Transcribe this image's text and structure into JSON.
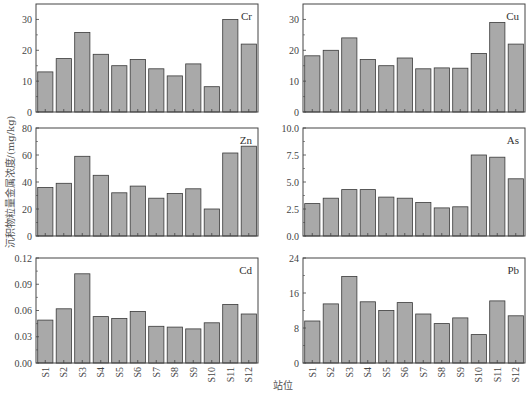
{
  "figure": {
    "ylabel": "沉积物粒量金属浓度/(mg/kg)",
    "xlabel": "站位"
  },
  "chart_data": [
    {
      "type": "bar",
      "title": "Cr",
      "categories": [
        "S1",
        "S2",
        "S3",
        "S4",
        "S5",
        "S6",
        "S7",
        "S8",
        "S9",
        "S10",
        "S11",
        "S12"
      ],
      "values": [
        13.0,
        17.3,
        25.8,
        18.7,
        15.0,
        17.0,
        14.0,
        11.7,
        15.6,
        8.2,
        30.0,
        22.0
      ],
      "ylim": [
        0,
        35
      ],
      "yticks": [
        0,
        10,
        20,
        30
      ],
      "ytick_labels": [
        "0",
        "10",
        "20",
        "30"
      ],
      "xlabel": "",
      "ylabel": "沉积物粒量金属浓度/(mg/kg)",
      "grid": false,
      "legend": "none",
      "position": "top-left"
    },
    {
      "type": "bar",
      "title": "Cu",
      "categories": [
        "S1",
        "S2",
        "S3",
        "S4",
        "S5",
        "S6",
        "S7",
        "S8",
        "S9",
        "S10",
        "S11",
        "S12"
      ],
      "values": [
        18.2,
        20.0,
        24.0,
        17.0,
        15.0,
        17.5,
        14.0,
        14.3,
        14.2,
        19.0,
        29.0,
        22.0
      ],
      "ylim": [
        0,
        35
      ],
      "yticks": [
        0,
        10,
        20,
        30
      ],
      "ytick_labels": [
        "0",
        "10",
        "20",
        "30"
      ],
      "xlabel": "",
      "ylabel": "",
      "grid": false,
      "legend": "none",
      "position": "top-right"
    },
    {
      "type": "bar",
      "title": "Zn",
      "categories": [
        "S1",
        "S2",
        "S3",
        "S4",
        "S5",
        "S6",
        "S7",
        "S8",
        "S9",
        "S10",
        "S11",
        "S12"
      ],
      "values": [
        36.0,
        39.0,
        59.0,
        45.0,
        32.0,
        37.0,
        28.0,
        31.5,
        35.0,
        20.0,
        61.5,
        66.5
      ],
      "ylim": [
        0,
        80
      ],
      "yticks": [
        0,
        20,
        40,
        60,
        80
      ],
      "ytick_labels": [
        "0",
        "20",
        "40",
        "60",
        "80"
      ],
      "xlabel": "",
      "ylabel": "",
      "grid": false,
      "legend": "none",
      "position": "middle-left"
    },
    {
      "type": "bar",
      "title": "As",
      "categories": [
        "S1",
        "S2",
        "S3",
        "S4",
        "S5",
        "S6",
        "S7",
        "S8",
        "S9",
        "S10",
        "S11",
        "S12"
      ],
      "values": [
        3.0,
        3.5,
        4.3,
        4.3,
        3.6,
        3.5,
        3.1,
        2.6,
        2.7,
        7.5,
        7.3,
        5.3
      ],
      "ylim": [
        0,
        10
      ],
      "yticks": [
        0,
        2.5,
        5,
        7.5,
        10
      ],
      "ytick_labels": [
        "0.0",
        "2.5",
        "5.0",
        "7.5",
        "10.0"
      ],
      "xlabel": "",
      "ylabel": "",
      "grid": false,
      "legend": "none",
      "position": "middle-right"
    },
    {
      "type": "bar",
      "title": "Cd",
      "categories": [
        "S1",
        "S2",
        "S3",
        "S4",
        "S5",
        "S6",
        "S7",
        "S8",
        "S9",
        "S10",
        "S11",
        "S12"
      ],
      "values": [
        0.049,
        0.062,
        0.102,
        0.053,
        0.051,
        0.059,
        0.042,
        0.041,
        0.039,
        0.046,
        0.067,
        0.056
      ],
      "ylim": [
        0,
        0.12
      ],
      "yticks": [
        0,
        0.03,
        0.06,
        0.09,
        0.12
      ],
      "ytick_labels": [
        "0.00",
        "0.03",
        "0.06",
        "0.09",
        "0.12"
      ],
      "xlabel": "站位",
      "ylabel": "",
      "grid": false,
      "legend": "none",
      "position": "bottom-left"
    },
    {
      "type": "bar",
      "title": "Pb",
      "categories": [
        "S1",
        "S2",
        "S3",
        "S4",
        "S5",
        "S6",
        "S7",
        "S8",
        "S9",
        "S10",
        "S11",
        "S12"
      ],
      "values": [
        9.6,
        13.5,
        19.8,
        14.0,
        12.0,
        13.8,
        11.2,
        9.0,
        10.3,
        6.5,
        14.2,
        10.8
      ],
      "ylim": [
        0,
        24
      ],
      "yticks": [
        0,
        8,
        16,
        24
      ],
      "ytick_labels": [
        "0",
        "8",
        "16",
        "24"
      ],
      "xlabel": "站位",
      "ylabel": "",
      "grid": false,
      "legend": "none",
      "position": "bottom-right"
    }
  ],
  "style": {
    "bar_fill": "#a9a9a9",
    "bar_stroke": "#3a3a3a",
    "axis_color": "#444444",
    "background": "#ffffff"
  }
}
